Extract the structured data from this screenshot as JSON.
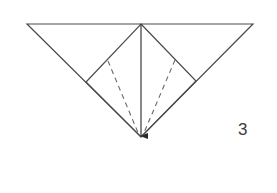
{
  "diagram": {
    "type": "origami-fold-step",
    "step_label": "3",
    "stroke_color": "#4a4a4a",
    "dash_color": "#6a6a6a",
    "outer_triangle": {
      "points": [
        [
          27,
          24
        ],
        [
          253,
          24
        ],
        [
          141,
          137
        ]
      ]
    },
    "inner_diamond": {
      "points": [
        [
          141,
          24
        ],
        [
          196,
          81
        ],
        [
          141,
          137
        ],
        [
          86,
          82
        ]
      ]
    },
    "center_arrow": {
      "from": [
        141,
        24
      ],
      "to": [
        141,
        137
      ],
      "direction": "down"
    },
    "dashed_fold_lines": [
      {
        "from": [
          108,
          61
        ],
        "to": [
          139,
          135
        ]
      },
      {
        "from": [
          175,
          60
        ],
        "to": [
          143,
          135
        ]
      }
    ]
  }
}
